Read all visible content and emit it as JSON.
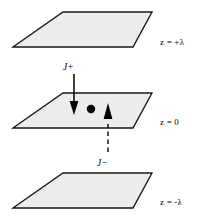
{
  "figure": {
    "background_color": "#ffffff",
    "plane_fill": "#ececec",
    "plane_stroke": "#1a1a1a",
    "accent_color": "#000000"
  },
  "planes": [
    {
      "id": "plane-top",
      "label": "z = +λ",
      "z_value": "+λ",
      "fill": "#ececec",
      "points": "63,12 152,12 133,47 13,47"
    },
    {
      "id": "plane-middle",
      "label": "z = 0",
      "z_value": "0",
      "fill": "#ececec",
      "points": "63,93 152,93 133,128 13,128"
    },
    {
      "id": "plane-bottom",
      "label": "z = -λ",
      "z_value": "-λ",
      "fill": "#ececec",
      "points": "63,173 152,173 133,208 13,208"
    }
  ],
  "currents": [
    {
      "id": "current-in",
      "symbol": "J",
      "sign": "+",
      "label": "J+",
      "direction": "down",
      "line_style": "solid",
      "description": "Solid arrow pointing down into the z = 0 plane"
    },
    {
      "id": "current-out",
      "symbol": "J",
      "sign": "−",
      "label": "J−",
      "direction": "up",
      "line_style": "dashed",
      "description": "Dashed arrow pointing up through the z = 0 plane"
    }
  ],
  "field_point": {
    "id": "field-point",
    "shape": "filled-circle",
    "cx": 91,
    "cy": 109,
    "r": 4.2,
    "color": "#000000"
  }
}
